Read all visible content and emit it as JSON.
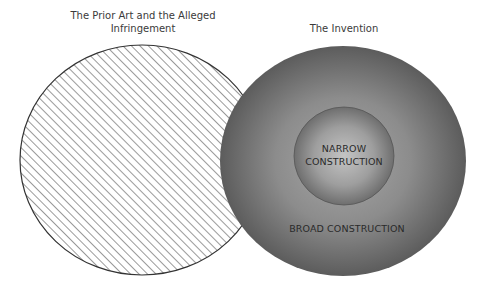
{
  "diagram": {
    "left_circle": {
      "title_line1": "The Prior Art and the Alleged",
      "title_line2": "Infringement",
      "fill": "hatched",
      "hatch_color": "#9a9a9a",
      "stroke_color": "#333333"
    },
    "right_circle": {
      "title": "The Invention",
      "outer_label": "BROAD CONSTRUCTION",
      "inner_label_line1": "NARROW",
      "inner_label_line2": "CONSTRUCTION",
      "edge_color": "#5a5a5a",
      "center_color": "#9a9a9a"
    }
  }
}
